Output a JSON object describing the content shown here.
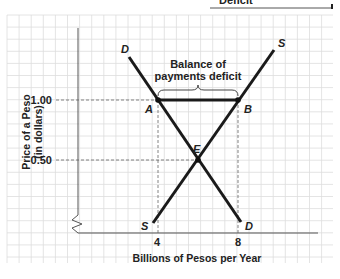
{
  "header": {
    "clipped_title": "Deficit"
  },
  "chart_data": {
    "type": "line",
    "title": "",
    "xlabel": "Billions of Pesos per Year",
    "ylabel": "Price of a Peso",
    "ylabel_sub": "(in dollars)",
    "x_ticks": [
      "4",
      "8"
    ],
    "y_ticks": [
      "1.00",
      "0.50"
    ],
    "grid": true,
    "series": [
      {
        "name": "D",
        "label_top": "D",
        "label_bottom": "D",
        "points": [
          [
            3.5,
            1.3
          ],
          [
            4,
            1.0
          ],
          [
            6,
            0.5
          ],
          [
            8,
            0.0
          ]
        ]
      },
      {
        "name": "S",
        "label_top": "S",
        "label_bottom": "S",
        "points": [
          [
            4,
            0.0
          ],
          [
            6,
            0.5
          ],
          [
            8,
            1.0
          ],
          [
            9.2,
            1.3
          ]
        ]
      }
    ],
    "points": [
      {
        "label": "A",
        "x": 4,
        "y": 1.0
      },
      {
        "label": "B",
        "x": 8,
        "y": 1.0
      },
      {
        "label": "E",
        "x": 6,
        "y": 0.5
      }
    ],
    "annotations": [
      {
        "text_line1": "Balance of",
        "text_line2": "payments deficit",
        "spans": [
          4,
          8
        ],
        "at_y": 1.0
      }
    ]
  }
}
